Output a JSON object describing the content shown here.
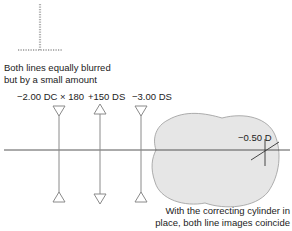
{
  "top_caption": {
    "line1": "Both lines equally blurred",
    "line2": "but by a small amount"
  },
  "lenses": [
    {
      "label": "−2.00 DC × 180",
      "type": "cylinder-negative",
      "icon": "concave-lens-icon"
    },
    {
      "label": "+150 DS",
      "type": "sphere-positive",
      "icon": "convex-lens-icon"
    },
    {
      "label": "−3.00 DS",
      "type": "sphere-negative",
      "icon": "concave-lens-icon"
    }
  ],
  "eye": {
    "label": "−0.50 D",
    "fill_color": "#e6e6e6",
    "stroke_color": "#9a9a9a"
  },
  "bottom_caption": {
    "line1": "With the correcting cylinder in",
    "line2": "place, both line images coincide"
  },
  "colors": {
    "line": "#444444",
    "lens": "#8a8a8a",
    "dots": "#b0b0b0"
  }
}
